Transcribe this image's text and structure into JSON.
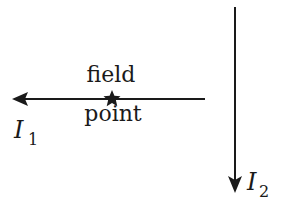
{
  "diagram": {
    "type": "physics-current-wires",
    "field_point_label": {
      "line1": "field",
      "line2": "point"
    },
    "currents": [
      {
        "id": "I1",
        "symbol": "I",
        "subscript": "1",
        "direction": "left",
        "orientation": "horizontal"
      },
      {
        "id": "I2",
        "symbol": "I",
        "subscript": "2",
        "direction": "down",
        "orientation": "vertical"
      }
    ],
    "marker": "star-icon",
    "colors": {
      "line": "#1a1a1a",
      "background": "#ffffff"
    }
  }
}
